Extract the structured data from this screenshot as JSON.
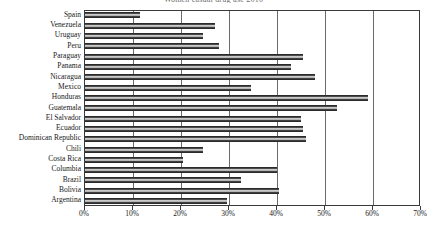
{
  "chart_data": {
    "type": "bar",
    "orientation": "horizontal",
    "title": "Women casual drug use 2010",
    "xlabel": "",
    "ylabel": "",
    "xlim": [
      0,
      70
    ],
    "xticks": [
      0,
      10,
      20,
      30,
      40,
      50,
      60,
      70
    ],
    "xtick_labels": [
      "0%",
      "10%",
      "20%",
      "30%",
      "40%",
      "50%",
      "60%",
      "70%"
    ],
    "grid": true,
    "legend": "none",
    "units": "percent",
    "categories": [
      "Spain",
      "Venezuela",
      "Uruguay",
      "Peru",
      "Paraguay",
      "Panama",
      "Nicaragua",
      "Mexico",
      "Honduras",
      "Guatemala",
      "El Salvador",
      "Ecuador",
      "Dominican Republic",
      "Chili",
      "Costa Rica",
      "Columbia",
      "Brazil",
      "Bolivia",
      "Argentina"
    ],
    "values": [
      11.5,
      27.0,
      24.5,
      28.0,
      45.5,
      43.0,
      48.0,
      34.5,
      59.0,
      52.5,
      45.0,
      45.5,
      46.0,
      24.5,
      20.5,
      40.0,
      32.5,
      40.5,
      29.5
    ]
  },
  "axis": {
    "x_axis_name": "percent-axis",
    "y_axis_name": "country-axis"
  }
}
